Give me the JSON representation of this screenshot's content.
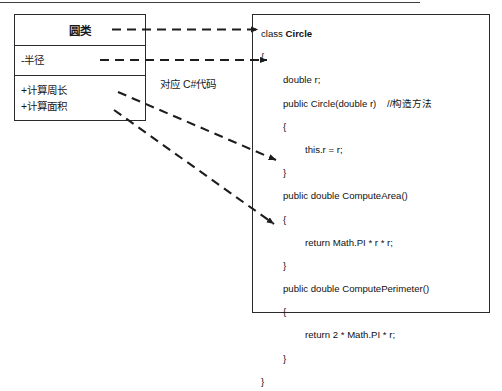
{
  "diagram": {
    "caption": "对应 C#代码"
  },
  "uml_class": {
    "name": "圆类",
    "attributes": [
      {
        "text": "-半径"
      }
    ],
    "operations": [
      {
        "text": "+计算周长"
      },
      {
        "text": "+计算面积"
      }
    ]
  },
  "code_block": {
    "language": "C#",
    "lines": [
      {
        "indent": 0,
        "prefix": "class ",
        "bold": "Circle",
        "suffix": ""
      },
      {
        "indent": 0,
        "prefix": "{",
        "bold": "",
        "suffix": ""
      },
      {
        "indent": 1,
        "prefix": "double r;",
        "bold": "",
        "suffix": ""
      },
      {
        "indent": 1,
        "prefix": "public Circle(double r)    //构造方法",
        "bold": "",
        "suffix": ""
      },
      {
        "indent": 1,
        "prefix": "{",
        "bold": "",
        "suffix": ""
      },
      {
        "indent": 2,
        "prefix": "this.r = r;",
        "bold": "",
        "suffix": ""
      },
      {
        "indent": 1,
        "prefix": "}",
        "bold": "",
        "suffix": ""
      },
      {
        "indent": 1,
        "prefix": "public double ComputeArea()",
        "bold": "",
        "suffix": ""
      },
      {
        "indent": 1,
        "prefix": "{",
        "bold": "",
        "suffix": ""
      },
      {
        "indent": 2,
        "prefix": "return Math.PI * r * r;",
        "bold": "",
        "suffix": ""
      },
      {
        "indent": 1,
        "prefix": "}",
        "bold": "",
        "suffix": ""
      },
      {
        "indent": 1,
        "prefix": "public double ComputePerimeter()",
        "bold": "",
        "suffix": ""
      },
      {
        "indent": 1,
        "prefix": "{",
        "bold": "",
        "suffix": ""
      },
      {
        "indent": 2,
        "prefix": "return 2 * Math.PI * r;",
        "bold": "",
        "suffix": ""
      },
      {
        "indent": 1,
        "prefix": "}",
        "bold": "",
        "suffix": ""
      },
      {
        "indent": 0,
        "prefix": "}",
        "bold": "",
        "suffix": ""
      }
    ]
  },
  "connectors": [
    {
      "name": "class-name-to-class-declaration",
      "from": "圆类",
      "to": "class Circle"
    },
    {
      "name": "attribute-to-field",
      "from": "-半径",
      "to": "double r;"
    },
    {
      "name": "operation-area-to-method",
      "from": "+计算面积",
      "to": "public double ComputeArea()"
    },
    {
      "name": "operation-perimeter-to-method",
      "from": "+计算周长",
      "to": "public double ComputePerimeter()"
    }
  ],
  "colors": {
    "stroke": "#2b2b2b",
    "text": "#111111",
    "background": "#ffffff"
  }
}
